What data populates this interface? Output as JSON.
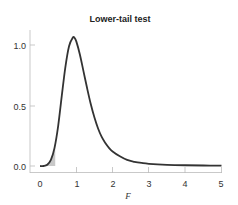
{
  "chart_data": {
    "type": "line",
    "title": "Lower-tail test",
    "xlabel": "F",
    "ylabel": "",
    "xlim": [
      0,
      5
    ],
    "ylim": [
      0,
      1.1
    ],
    "xticks": [
      "0",
      "1",
      "2",
      "3",
      "4",
      "5"
    ],
    "yticks": [
      "0.0",
      "0.5",
      "1.0"
    ],
    "grid": false,
    "legend": null,
    "series": [
      {
        "name": "F density",
        "x": [
          0.0,
          0.1,
          0.2,
          0.3,
          0.4,
          0.5,
          0.6,
          0.7,
          0.8,
          0.9,
          0.95,
          1.0,
          1.1,
          1.2,
          1.3,
          1.4,
          1.5,
          1.6,
          1.7,
          1.8,
          1.9,
          2.0,
          2.2,
          2.4,
          2.6,
          2.8,
          3.0,
          3.5,
          4.0,
          4.5,
          5.0
        ],
        "values": [
          0.0,
          0.0,
          0.01,
          0.05,
          0.15,
          0.33,
          0.58,
          0.82,
          0.99,
          1.06,
          1.06,
          1.03,
          0.92,
          0.78,
          0.64,
          0.51,
          0.4,
          0.31,
          0.24,
          0.19,
          0.15,
          0.12,
          0.08,
          0.05,
          0.035,
          0.025,
          0.018,
          0.01,
          0.006,
          0.004,
          0.003
        ]
      }
    ],
    "shaded_region": {
      "label": "lower tail",
      "x_from": 0.0,
      "x_to": 0.42,
      "color": "#c8c8c8"
    },
    "line_color": "#333333"
  },
  "labels": {
    "title": "Lower-tail test",
    "xlabel": "F",
    "xticks": [
      "0",
      "1",
      "2",
      "3",
      "4",
      "5"
    ],
    "yticks": [
      "0.0",
      "0.5",
      "1.0"
    ]
  }
}
